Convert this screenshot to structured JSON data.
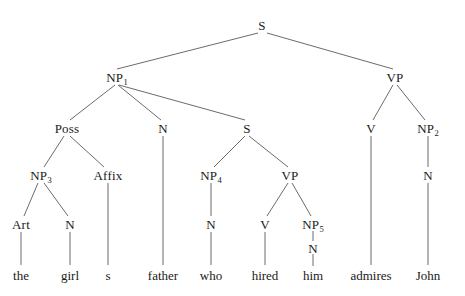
{
  "figure": {
    "kind": "syntax-tree",
    "sentence": "the girl s father who hired him admires John",
    "width": 465,
    "height": 296,
    "line_color": "#5a5a5a",
    "text_color": "#1a1a1a",
    "background": "#ffffff"
  },
  "nodes": [
    {
      "id": "S0",
      "label": "S",
      "sub": "",
      "x": 262,
      "y": 25
    },
    {
      "id": "NP1",
      "label": "NP",
      "sub": "1",
      "x": 117,
      "y": 77
    },
    {
      "id": "VP0",
      "label": "VP",
      "sub": "",
      "x": 395,
      "y": 77
    },
    {
      "id": "Poss",
      "label": "Poss",
      "sub": "",
      "x": 67,
      "y": 128
    },
    {
      "id": "N1",
      "label": "N",
      "sub": "",
      "x": 163,
      "y": 128
    },
    {
      "id": "S1",
      "label": "S",
      "sub": "",
      "x": 247,
      "y": 128
    },
    {
      "id": "V0",
      "label": "V",
      "sub": "",
      "x": 371,
      "y": 128
    },
    {
      "id": "NP2",
      "label": "NP",
      "sub": "2",
      "x": 428,
      "y": 128
    },
    {
      "id": "NP3",
      "label": "NP",
      "sub": "3",
      "x": 41,
      "y": 175
    },
    {
      "id": "Affix",
      "label": "Affix",
      "sub": "",
      "x": 108,
      "y": 175
    },
    {
      "id": "NP4",
      "label": "NP",
      "sub": "4",
      "x": 211,
      "y": 175
    },
    {
      "id": "VP1",
      "label": "VP",
      "sub": "",
      "x": 290,
      "y": 175
    },
    {
      "id": "N2",
      "label": "N",
      "sub": "",
      "x": 428,
      "y": 175
    },
    {
      "id": "Art",
      "label": "Art",
      "sub": "",
      "x": 21,
      "y": 224
    },
    {
      "id": "N3",
      "label": "N",
      "sub": "",
      "x": 70,
      "y": 224
    },
    {
      "id": "N4",
      "label": "N",
      "sub": "",
      "x": 211,
      "y": 224
    },
    {
      "id": "V1",
      "label": "V",
      "sub": "",
      "x": 265,
      "y": 224
    },
    {
      "id": "NP5",
      "label": "NP",
      "sub": "5",
      "x": 313,
      "y": 224
    },
    {
      "id": "N5",
      "label": "N",
      "sub": "",
      "x": 313,
      "y": 248
    }
  ],
  "leaves": [
    {
      "id": "w-the",
      "label": "the",
      "x": 21,
      "y": 275
    },
    {
      "id": "w-girl",
      "label": "girl",
      "x": 70,
      "y": 275
    },
    {
      "id": "w-s",
      "label": "s",
      "x": 108,
      "y": 275
    },
    {
      "id": "w-father",
      "label": "father",
      "x": 163,
      "y": 275
    },
    {
      "id": "w-who",
      "label": "who",
      "x": 211,
      "y": 275
    },
    {
      "id": "w-hired",
      "label": "hired",
      "x": 265,
      "y": 275
    },
    {
      "id": "w-him",
      "label": "him",
      "x": 313,
      "y": 275
    },
    {
      "id": "w-admires",
      "label": "admires",
      "x": 371,
      "y": 275
    },
    {
      "id": "w-John",
      "label": "John",
      "x": 428,
      "y": 275
    }
  ],
  "edges": [
    {
      "from": "S0",
      "to": "NP1",
      "x1": 258,
      "y1": 33,
      "x2": 117,
      "y2": 69
    },
    {
      "from": "S0",
      "to": "VP0",
      "x1": 267,
      "y1": 33,
      "x2": 393,
      "y2": 69
    },
    {
      "from": "NP1",
      "to": "Poss",
      "x1": 115,
      "y1": 85,
      "x2": 70,
      "y2": 120
    },
    {
      "from": "NP1",
      "to": "N1",
      "x1": 118,
      "y1": 85,
      "x2": 161,
      "y2": 120
    },
    {
      "from": "NP1",
      "to": "S1",
      "x1": 119,
      "y1": 85,
      "x2": 245,
      "y2": 120
    },
    {
      "from": "VP0",
      "to": "V0",
      "x1": 393,
      "y1": 85,
      "x2": 373,
      "y2": 120
    },
    {
      "from": "VP0",
      "to": "NP2",
      "x1": 397,
      "y1": 85,
      "x2": 425,
      "y2": 120
    },
    {
      "from": "Poss",
      "to": "NP3",
      "x1": 64,
      "y1": 136,
      "x2": 44,
      "y2": 167
    },
    {
      "from": "Poss",
      "to": "Affix",
      "x1": 70,
      "y1": 136,
      "x2": 104,
      "y2": 167
    },
    {
      "from": "S1",
      "to": "NP4",
      "x1": 245,
      "y1": 136,
      "x2": 214,
      "y2": 167
    },
    {
      "from": "S1",
      "to": "VP1",
      "x1": 249,
      "y1": 136,
      "x2": 288,
      "y2": 167
    },
    {
      "from": "N1",
      "to": "w-father",
      "x1": 163,
      "y1": 136,
      "x2": 163,
      "y2": 265
    },
    {
      "from": "V0",
      "to": "w-admires",
      "x1": 371,
      "y1": 136,
      "x2": 371,
      "y2": 265
    },
    {
      "from": "NP2",
      "to": "N2",
      "x1": 428,
      "y1": 136,
      "x2": 428,
      "y2": 167
    },
    {
      "from": "N2",
      "to": "w-John",
      "x1": 428,
      "y1": 183,
      "x2": 428,
      "y2": 265
    },
    {
      "from": "NP3",
      "to": "Art",
      "x1": 38,
      "y1": 183,
      "x2": 24,
      "y2": 216
    },
    {
      "from": "NP3",
      "to": "N3",
      "x1": 44,
      "y1": 183,
      "x2": 68,
      "y2": 216
    },
    {
      "from": "Affix",
      "to": "w-s",
      "x1": 108,
      "y1": 183,
      "x2": 108,
      "y2": 265
    },
    {
      "from": "NP4",
      "to": "N4",
      "x1": 211,
      "y1": 183,
      "x2": 211,
      "y2": 216
    },
    {
      "from": "VP1",
      "to": "V1",
      "x1": 288,
      "y1": 183,
      "x2": 267,
      "y2": 216
    },
    {
      "from": "VP1",
      "to": "NP5",
      "x1": 292,
      "y1": 183,
      "x2": 311,
      "y2": 216
    },
    {
      "from": "Art",
      "to": "w-the",
      "x1": 21,
      "y1": 232,
      "x2": 21,
      "y2": 265
    },
    {
      "from": "N3",
      "to": "w-girl",
      "x1": 70,
      "y1": 232,
      "x2": 70,
      "y2": 265
    },
    {
      "from": "N4",
      "to": "w-who",
      "x1": 211,
      "y1": 232,
      "x2": 211,
      "y2": 265
    },
    {
      "from": "V1",
      "to": "w-hired",
      "x1": 265,
      "y1": 232,
      "x2": 265,
      "y2": 265
    },
    {
      "from": "NP5",
      "to": "N5",
      "x1": 313,
      "y1": 231,
      "x2": 313,
      "y2": 241
    },
    {
      "from": "N5",
      "to": "w-him",
      "x1": 313,
      "y1": 254,
      "x2": 313,
      "y2": 266
    }
  ]
}
